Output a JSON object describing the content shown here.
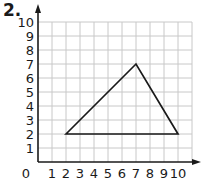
{
  "problem": {
    "number_label": "2."
  },
  "chart_data": {
    "type": "diagram",
    "title": "",
    "x_axis": {
      "min": 0,
      "max": 10,
      "grid_extent": 11,
      "tick_labels": [
        "1",
        "2",
        "3",
        "4",
        "5",
        "6",
        "7",
        "8",
        "9",
        "10"
      ]
    },
    "y_axis": {
      "min": 0,
      "max": 10,
      "tick_labels": [
        "1",
        "2",
        "3",
        "4",
        "5",
        "6",
        "7",
        "8",
        "9",
        "10"
      ]
    },
    "origin_label": "0",
    "grid": true,
    "shapes": [
      {
        "type": "triangle",
        "vertices": [
          [
            2,
            2
          ],
          [
            7,
            7
          ],
          [
            10,
            2
          ]
        ]
      }
    ]
  },
  "colors": {
    "grid": "#c8c8c8",
    "axis": "#1a1a1a",
    "shape": "#1a1a1a"
  }
}
